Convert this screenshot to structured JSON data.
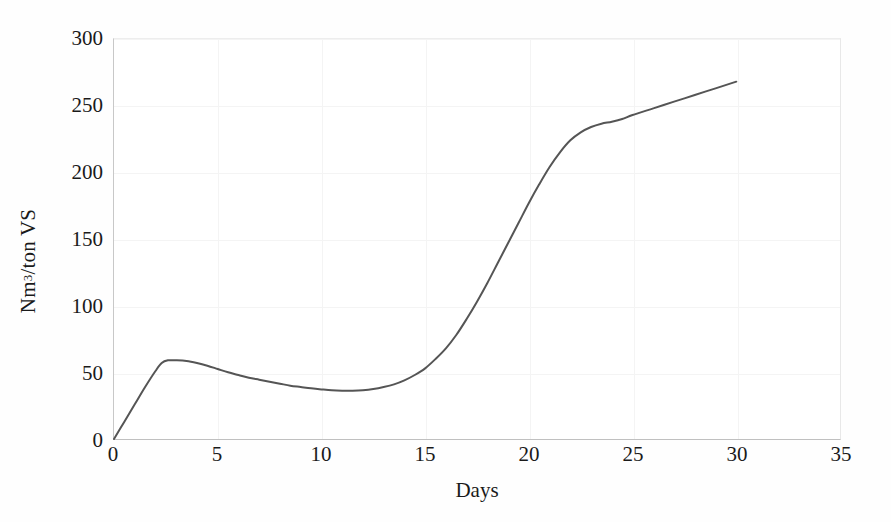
{
  "chart_data": {
    "type": "line",
    "title": "",
    "xlabel": "Days",
    "ylabel": "Nm3/ton VS",
    "ylabel_parts": {
      "pre": "Nm",
      "sup": "3",
      "post": "/ton VS"
    },
    "xlim": [
      0,
      35
    ],
    "ylim": [
      0,
      300
    ],
    "xticks": [
      0,
      5,
      10,
      15,
      20,
      25,
      30,
      35
    ],
    "yticks": [
      0,
      50,
      100,
      150,
      200,
      250,
      300
    ],
    "xtick_labels": [
      "0",
      "5",
      "10",
      "15",
      "20",
      "25",
      "30",
      "35"
    ],
    "ytick_labels": [
      "0",
      "50",
      "100",
      "150",
      "200",
      "250",
      "300"
    ],
    "grid": true,
    "legend": null,
    "line_color": "#555555",
    "line_width": 2,
    "series": [
      {
        "name": "Cumulative biogas yield",
        "x": [
          0,
          0.5,
          1.0,
          1.5,
          2.0,
          2.3,
          2.6,
          3.0,
          3.5,
          4.0,
          4.5,
          5.0,
          5.5,
          6.0,
          6.5,
          7.0,
          7.5,
          8.0,
          8.5,
          9.0,
          9.5,
          10.0,
          10.5,
          11.0,
          11.5,
          12.0,
          12.5,
          13.0,
          13.5,
          14.0,
          14.5,
          15.0,
          15.5,
          16.0,
          16.5,
          17.0,
          17.5,
          18.0,
          18.5,
          19.0,
          19.5,
          20.0,
          20.5,
          21.0,
          21.5,
          22.0,
          22.5,
          23.0,
          23.5,
          24.0,
          24.5,
          25.0,
          26.0,
          27.0,
          28.0,
          29.0,
          30.0
        ],
        "values": [
          0,
          13,
          26,
          39,
          51,
          57,
          59,
          59,
          58.5,
          57,
          55,
          52.5,
          50,
          48,
          46,
          44.5,
          43,
          41.5,
          40,
          39,
          38,
          37.2,
          36.5,
          36.2,
          36.2,
          36.6,
          37.5,
          39,
          41,
          44,
          48,
          53,
          60,
          68,
          78,
          90,
          103,
          117,
          132,
          147,
          162,
          177,
          191,
          204,
          215,
          224,
          230,
          234,
          236.5,
          238,
          240,
          243,
          248,
          253,
          258,
          263,
          268
        ]
      }
    ],
    "annotations": {
      "initial_peak": {
        "day": 2.6,
        "value": 59
      },
      "trough": {
        "day": 11.2,
        "value": 36
      },
      "final": {
        "day": 30,
        "value": 268
      }
    }
  }
}
